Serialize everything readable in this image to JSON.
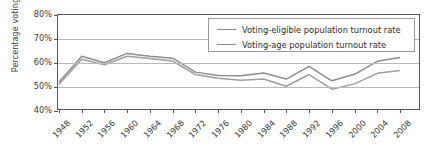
{
  "chart_data": {
    "type": "line",
    "title": "",
    "xlabel": "",
    "ylabel": "Percentage voting",
    "x": [
      1948,
      1952,
      1956,
      1960,
      1964,
      1968,
      1972,
      1976,
      1980,
      1984,
      1988,
      1992,
      1996,
      2000,
      2004,
      2008
    ],
    "xticklabels": [
      "1948",
      "1952",
      "1956",
      "1960",
      "1964",
      "1968",
      "1972",
      "1976",
      "1980",
      "1984",
      "1988",
      "1992",
      "1996",
      "2000",
      "2004",
      "2008"
    ],
    "yticklabels": [
      "80%",
      "70%",
      "60%",
      "50%",
      "40%"
    ],
    "yticks": [
      80,
      70,
      60,
      50,
      40
    ],
    "ylim": [
      40,
      80
    ],
    "grid": true,
    "legend_position": "top-right",
    "series": [
      {
        "name": "Voting-eligible population turnout rate",
        "color": "#8c8c8c",
        "values": [
          52.0,
          62.8,
          60.1,
          64.0,
          62.8,
          62.0,
          56.2,
          54.8,
          54.7,
          55.8,
          53.3,
          58.6,
          52.6,
          55.3,
          60.7,
          62.3
        ]
      },
      {
        "name": "Voting-age population turnout rate",
        "color": "#9e9e9e",
        "values": [
          51.1,
          61.6,
          59.3,
          62.8,
          61.9,
          60.8,
          55.2,
          53.6,
          52.8,
          53.3,
          50.3,
          55.2,
          49.1,
          51.3,
          55.7,
          56.9
        ]
      }
    ]
  },
  "axis": {
    "y_title": "Percentage voting"
  },
  "legend": {
    "entries": [
      {
        "label": "Voting-eligible population turnout rate"
      },
      {
        "label": "Voting-age population turnout rate"
      }
    ]
  }
}
